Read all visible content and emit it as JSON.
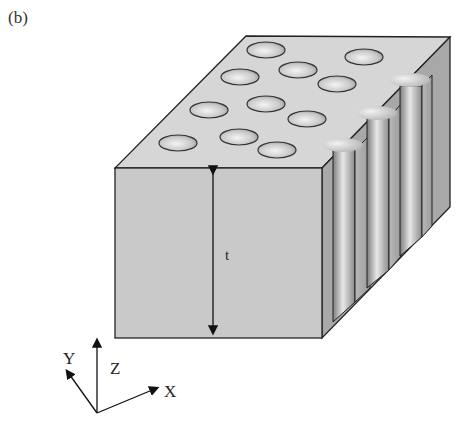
{
  "figure": {
    "panel_label": "(b)",
    "thickness_label": "t",
    "axes": {
      "x_label": "X",
      "y_label": "Y",
      "z_label": "Z"
    },
    "top_face_holes": 12,
    "cutaway_channels": 3,
    "colors": {
      "face_front": "#c9c9c9",
      "face_top": "#d4d4d4",
      "face_side": "#a9a9a9",
      "outline": "#222222"
    }
  }
}
